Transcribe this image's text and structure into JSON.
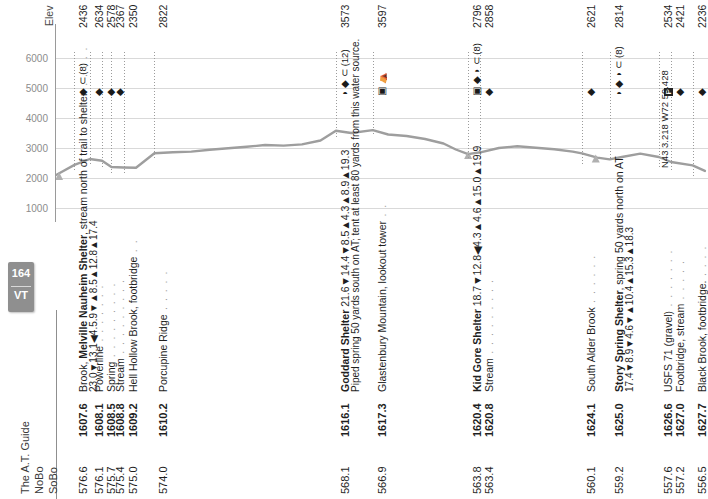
{
  "page": {
    "badge_number": "164",
    "badge_state": "VT",
    "guide_title": "The A.T. Guide"
  },
  "columns": {
    "sobo": "SoBo",
    "nobo": "NoBo",
    "elev": "Elev"
  },
  "chart_data": {
    "type": "line",
    "xlabel": "NoBo mile",
    "ylabel": "Elev",
    "ylim": [
      0,
      6500
    ],
    "yticks": [
      1000,
      2000,
      3000,
      4000,
      5000,
      6000
    ],
    "grid": true,
    "xlim": [
      1607.0,
      1628.2
    ],
    "x": [
      1607.0,
      1607.6,
      1608.1,
      1608.5,
      1608.8,
      1609.2,
      1609.6,
      1610.2,
      1610.8,
      1611.4,
      1612.0,
      1612.6,
      1613.2,
      1613.8,
      1614.4,
      1615.0,
      1615.6,
      1616.1,
      1616.6,
      1617.3,
      1617.8,
      1618.4,
      1619.0,
      1619.6,
      1620.0,
      1620.4,
      1620.8,
      1621.4,
      1622.0,
      1622.6,
      1623.2,
      1623.8,
      1624.1,
      1624.6,
      1625.0,
      1625.4,
      1626.0,
      1626.6,
      1627.0,
      1627.7,
      1628.1
    ],
    "y": [
      2100,
      2436,
      2634,
      2578,
      2367,
      2350,
      2340,
      2822,
      2860,
      2880,
      2940,
      2990,
      3040,
      3100,
      3080,
      3120,
      3250,
      3573,
      3500,
      3597,
      3450,
      3400,
      3300,
      3150,
      2950,
      2796,
      2858,
      3000,
      3060,
      3010,
      2960,
      2880,
      2820,
      2680,
      2621,
      2700,
      2814,
      2700,
      2534,
      2421,
      2236
    ],
    "elevation_labels": [
      2436,
      2634,
      2578,
      2367,
      2350,
      2822,
      3573,
      3597,
      2796,
      2858,
      2621,
      2814,
      2534,
      2421,
      2236
    ]
  },
  "rows": [
    {
      "sobo": "576.6",
      "nobo": "1607.6",
      "elev": "2436",
      "icons": "◆ ⊂ (8)",
      "guide_bold_prefix": "Brook, ",
      "guide_bold": "Melville Nauheim Shelter",
      "guide_rest": ", stream north of trail to shelter.",
      "dots": " . . . . .",
      "sub": "23.0▼13.1◀4.5.9▼▲8.5▲12.8▲17.4"
    },
    {
      "sobo": "576.1",
      "nobo": "1608.1",
      "elev": "2634",
      "icons": "◆",
      "guide_rest": "Powerline",
      "dots": " . . . . . . ."
    },
    {
      "sobo": "575.7",
      "nobo": "1608.5",
      "elev": "2578",
      "icons": "◆",
      "guide_rest": "Spring",
      "dots": " . . . . . . . . ."
    },
    {
      "sobo": "575.4",
      "nobo": "1608.8",
      "elev": "2367",
      "icons": "◆",
      "guide_rest": "Stream",
      "dots": " . . . . . . . . ."
    },
    {
      "sobo": "575.0",
      "nobo": "1609.2",
      "elev": "2350",
      "icons": "",
      "guide_rest": "Hell Hollow Brook, footbridge",
      "dots": " . ."
    },
    {
      "sobo": "574.0",
      "nobo": "1610.2",
      "elev": "2822",
      "icons": "",
      "guide_rest": "Porcupine Ridge",
      "dots": " . . . . ."
    },
    {
      "sobo": "568.1",
      "nobo": "1616.1",
      "elev": "3573",
      "icons": "◗ ◆ ⊂ (12)",
      "guide_bold": "Goddard Shelter",
      "guide_rest": " 21.6▼14.4▼8.5▲4.3▲8.9▲19.3",
      "dots": "",
      "sub": "Piped spring 50 yards south on AT; tent at least 80 yards from this water source."
    },
    {
      "sobo": "566.9",
      "nobo": "1617.3",
      "elev": "3597",
      "icons": "▣ ⛺",
      "guide_rest": "Glastenbury Mountain, lookout tower",
      "dots": " . ."
    },
    {
      "sobo": "563.8",
      "nobo": "1620.4",
      "elev": "2796",
      "icons": "▣ ◆ ◗ ⊂ (8)",
      "guide_bold": "Kid Gore Shelter",
      "guide_rest": " 18.7▼12.8◀4.3▲4.6▲15.0▲19.9",
      "dots": ""
    },
    {
      "sobo": "563.4",
      "nobo": "1620.8",
      "elev": "2858",
      "icons": "◆",
      "guide_rest": "Stream",
      "dots": " . . . . . . . . ."
    },
    {
      "sobo": "560.1",
      "nobo": "1624.1",
      "elev": "2621",
      "icons": "◆",
      "guide_rest": "South Alder Brook",
      "dots": " . . . . . ."
    },
    {
      "sobo": "559.2",
      "nobo": "1625.0",
      "elev": "2814",
      "icons": "◗ ◆ ◗ ⊂ (8)",
      "guide_bold": "Story Spring Shelter",
      "guide_rest": ", spring 50 yards north on AT",
      "dots": "",
      "sub": "17.4▼8.9▼4.6▼▲10.4▲15.3▲18.3"
    },
    {
      "sobo": "557.6",
      "nobo": "1626.6",
      "elev": "2534",
      "icons": "P",
      "icon_type": "parking",
      "guide_rest": "USFS 71 (gravel)",
      "dots": " . . . . . . ."
    },
    {
      "sobo": "557.2",
      "nobo": "1627.0",
      "elev": "2421",
      "icons": "◆",
      "guide_rest": "Footbridge, stream",
      "dots": " . . . . ."
    },
    {
      "sobo": "556.5",
      "nobo": "1627.7",
      "elev": "2236",
      "icons": "◆",
      "guide_rest": "Black Brook, footbridge.",
      "dots": " . . . ."
    }
  ],
  "coordinates": {
    "label": "N43 3.218 W72 59.428"
  },
  "colors": {
    "profile_line": "#9e9e9e",
    "gridline": "#d9d9d9",
    "axis_text": "#8c8c8c",
    "badge_bg": "#8f8f8f",
    "dots": "#9b9b9b"
  }
}
